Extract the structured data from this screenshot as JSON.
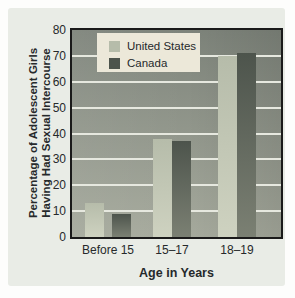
{
  "chart_data": {
    "type": "bar",
    "categories": [
      "Before 15",
      "15–17",
      "18–19"
    ],
    "series": [
      {
        "name": "United States",
        "values": [
          13,
          38,
          70
        ]
      },
      {
        "name": "Canada",
        "values": [
          9,
          37,
          71
        ]
      }
    ],
    "ylabel_line1": "Percentage of Adolescent Girls",
    "ylabel_line2": "Having Had Sexual Intercourse",
    "xlabel": "Age in Years",
    "ylim": [
      0,
      80
    ],
    "ytick_step": 10,
    "yticks": [
      0,
      10,
      20,
      30,
      40,
      50,
      60,
      70,
      80
    ],
    "grid": true,
    "legend_position": "top-left-inside",
    "colors": {
      "card_bg": "#e9ece6",
      "plot_bg_top": "#7e847b",
      "plot_bg_bottom": "#a6aa9d",
      "gridline": "#e6e8df",
      "us_bar_top": "#b6bcaa",
      "us_bar_bottom": "#ced2c0",
      "canada_bar_top": "#4d544c",
      "canada_bar_bottom": "#7b8073",
      "legend_bg": "#ece8d9",
      "text": "#26292b",
      "border": "#1a1a1a"
    },
    "layout": {
      "plot": {
        "left": 64,
        "top": 22,
        "width": 209,
        "height": 207
      },
      "group_centers_px": [
        36,
        100,
        165
      ],
      "bar_width_px": 19,
      "group_inner_gap_px": [
        8,
        0,
        0
      ]
    }
  }
}
